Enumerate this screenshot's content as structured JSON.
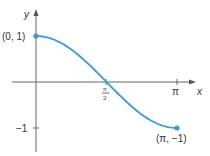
{
  "chart_data": {
    "type": "line",
    "title": "",
    "function": "y = cos(x)",
    "x": [
      0,
      0.3927,
      0.7854,
      1.1781,
      1.5708,
      1.9635,
      2.3562,
      2.7489,
      3.1416
    ],
    "series": [
      {
        "name": "y = cos x",
        "values": [
          1,
          0.9239,
          0.7071,
          0.3827,
          0,
          -0.3827,
          -0.7071,
          -0.9239,
          -1
        ]
      }
    ],
    "xlabel": "x",
    "ylabel": "y",
    "xlim": [
      0,
      3.1416
    ],
    "ylim": [
      -1,
      1
    ],
    "x_ticks": [
      "π/2",
      "π"
    ],
    "y_ticks": [
      "−1"
    ],
    "grid": false,
    "legend": null,
    "annotations": [
      {
        "text": "(0, 1)",
        "point": [
          0,
          1
        ]
      },
      {
        "text": "(π, −1)",
        "point": [
          3.1416,
          -1
        ]
      }
    ],
    "curve_color": "#3a9ad9",
    "axis_color": "#555555"
  },
  "labels": {
    "y_axis": "y",
    "x_axis": "x",
    "start_point": "(0, 1)",
    "end_point": "(π, −1)",
    "tick_pi": "π",
    "tick_half_num": "π",
    "tick_half_den": "2",
    "tick_neg_one": "−1"
  }
}
